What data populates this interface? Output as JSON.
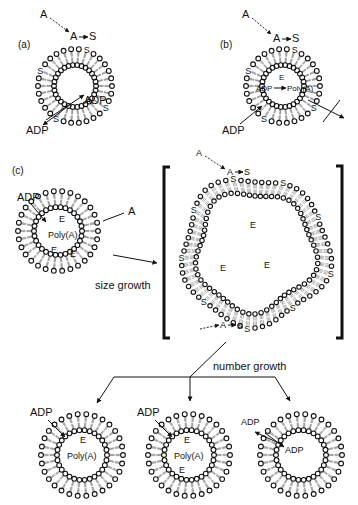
{
  "figure": {
    "colors": {
      "ink": "#111111",
      "background": "#ffffff"
    },
    "panels": {
      "a": {
        "label": "(a)",
        "precursor": "A",
        "reaction": {
          "from": "A",
          "to": "S"
        },
        "transport": {
          "in": "ADP",
          "out": "ADP"
        }
      },
      "b": {
        "label": "(b)",
        "precursor": "A",
        "reaction": {
          "from": "A",
          "to": "S"
        },
        "inside_reaction": {
          "catalyst": "E",
          "substrate": "ADP",
          "product": "Poly(A)"
        },
        "transport_in": "ADP"
      },
      "c": {
        "label": "(c)",
        "small_vesicle": {
          "entering": "ADP",
          "precursor": "A",
          "contents": [
            "E",
            "Poly(A)",
            "E",
            "E"
          ]
        },
        "size_growth_label": "size growth",
        "large_vesicle": {
          "precursor_top": "A",
          "reaction_top": {
            "from": "A",
            "to": "S"
          },
          "reaction_bottom": {
            "from": "A",
            "to": "S"
          },
          "contents": [
            "E",
            "E",
            "E"
          ]
        },
        "number_growth_label": "number growth",
        "daughters": [
          {
            "entering": "ADP",
            "contents": [
              "E",
              "Poly(A)"
            ]
          },
          {
            "entering": "ADP",
            "contents": [
              "E",
              "Poly(A)",
              "E"
            ]
          },
          {
            "entering": "ADP",
            "inside": "ADP",
            "contents": []
          }
        ]
      }
    },
    "surfactant_symbol": "S"
  }
}
